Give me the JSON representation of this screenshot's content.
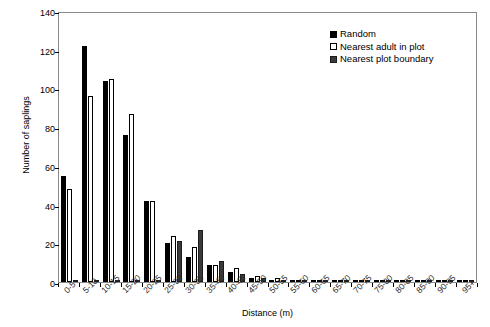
{
  "chart_data": {
    "type": "bar",
    "title": "",
    "xlabel": "Distance (m)",
    "ylabel": "Number of saplings",
    "ylim": [
      0,
      140
    ],
    "ytick_step": 20,
    "yticks": [
      0,
      20,
      40,
      60,
      80,
      100,
      120,
      140
    ],
    "grid": false,
    "legend_position": "top-right",
    "categories": [
      "0-5",
      "5-10",
      "10-15",
      "15-20",
      "20-25",
      "25-30",
      "30-35",
      "35-40",
      "40-45",
      "45-50",
      "50-55",
      "55-60",
      "60-65",
      "65-70",
      "70-75",
      "75-80",
      "80-85",
      "85-90",
      "90-95",
      "95+"
    ],
    "series": [
      {
        "name": "Random",
        "color": "#000000",
        "values": [
          55,
          122,
          104,
          76,
          42,
          20,
          13,
          9,
          5,
          2,
          1,
          0,
          0,
          0,
          0,
          0,
          0,
          0,
          0,
          0
        ]
      },
      {
        "name": "Nearest adult in plot",
        "color": "#ffffff",
        "values": [
          48,
          96,
          105,
          87,
          42,
          24,
          18,
          9,
          7,
          3,
          2,
          1,
          0,
          0,
          0,
          0,
          0,
          0,
          0,
          0
        ]
      },
      {
        "name": "Nearest plot boundary",
        "color": "#3a3a3a",
        "values": [
          0,
          0,
          0,
          0,
          0,
          21,
          27,
          11,
          4,
          2,
          1,
          0,
          0,
          0,
          0,
          0,
          0,
          0,
          0,
          0
        ]
      }
    ]
  },
  "legend": {
    "items": [
      {
        "label": "Random"
      },
      {
        "label": "Nearest adult in plot"
      },
      {
        "label": "Nearest plot boundary"
      }
    ]
  }
}
